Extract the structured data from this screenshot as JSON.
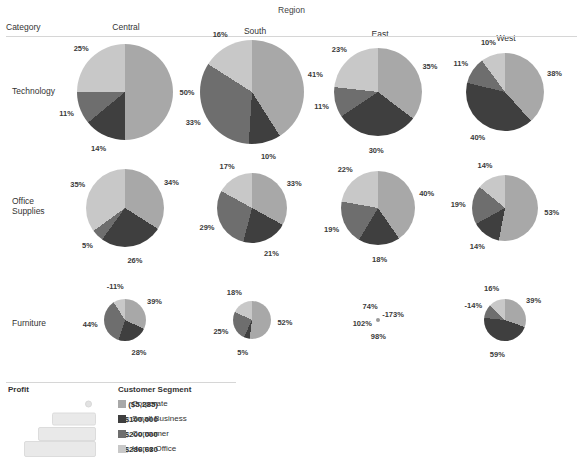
{
  "header": {
    "region_title": "Region",
    "category_header": "Category",
    "columns": [
      "Central",
      "South",
      "East",
      "West"
    ]
  },
  "rows": [
    "Technology",
    "Office Supplies",
    "Furniture"
  ],
  "legend": {
    "profit_title": "Profit",
    "segment_title": "Customer Segment",
    "profit_scale": [
      {
        "label": "($5,285)"
      },
      {
        "label": "$100,000"
      },
      {
        "label": "$200,000"
      },
      {
        "label": "$286,630"
      }
    ],
    "segments": [
      {
        "name": "Corporate",
        "color": "#a8a8a8"
      },
      {
        "name": "Small Business",
        "color": "#3f3f3f"
      },
      {
        "name": "Consumer",
        "color": "#6e6e6e"
      },
      {
        "name": "Home Office",
        "color": "#c8c8c8"
      }
    ]
  },
  "chart_data": {
    "type": "pie",
    "title": "Region",
    "xlabel": "Region",
    "ylabel": "Category",
    "legend_position": "bottom-left",
    "grid": false,
    "segment_names": [
      "Corporate",
      "Small Business",
      "Consumer",
      "Home Office"
    ],
    "segment_colors": [
      "#a8a8a8",
      "#3f3f3f",
      "#6e6e6e",
      "#c8c8c8"
    ],
    "columns": [
      "Central",
      "South",
      "East",
      "West"
    ],
    "categories": [
      "Technology",
      "Office Supplies",
      "Furniture"
    ],
    "cells": [
      {
        "category": "Technology",
        "region": "Central",
        "size": 96,
        "labels": [
          "50%",
          "14%",
          "11%",
          "25%"
        ],
        "values": [
          50,
          14,
          11,
          25
        ]
      },
      {
        "category": "Technology",
        "region": "South",
        "size": 104,
        "labels": [
          "41%",
          "10%",
          "33%",
          "16%"
        ],
        "values": [
          41,
          10,
          33,
          16
        ]
      },
      {
        "category": "Technology",
        "region": "East",
        "size": 88,
        "labels": [
          "35%",
          "30%",
          "11%",
          "23%"
        ],
        "values": [
          35,
          30,
          11,
          23
        ]
      },
      {
        "category": "Technology",
        "region": "West",
        "size": 78,
        "labels": [
          "38%",
          "40%",
          "11%",
          "10%"
        ],
        "values": [
          38,
          40,
          11,
          10
        ]
      },
      {
        "category": "Office Supplies",
        "region": "Central",
        "size": 78,
        "labels": [
          "34%",
          "26%",
          "5%",
          "35%"
        ],
        "values": [
          34,
          26,
          5,
          35
        ]
      },
      {
        "category": "Office Supplies",
        "region": "South",
        "size": 70,
        "labels": [
          "33%",
          "21%",
          "29%",
          "17%"
        ],
        "values": [
          33,
          21,
          29,
          17
        ]
      },
      {
        "category": "Office Supplies",
        "region": "East",
        "size": 74,
        "labels": [
          "40%",
          "18%",
          "19%",
          "22%"
        ],
        "values": [
          40,
          18,
          19,
          22
        ]
      },
      {
        "category": "Office Supplies",
        "region": "West",
        "size": 66,
        "labels": [
          "53%",
          "14%",
          "19%",
          "14%"
        ],
        "values": [
          53,
          14,
          19,
          14
        ]
      },
      {
        "category": "Furniture",
        "region": "Central",
        "size": 42,
        "labels": [
          "39%",
          "28%",
          "44%",
          "-11%"
        ],
        "values": [
          39,
          28,
          44,
          -11
        ]
      },
      {
        "category": "Furniture",
        "region": "South",
        "size": 38,
        "labels": [
          "52%",
          "5%",
          "25%",
          "18%"
        ],
        "values": [
          52,
          5,
          25,
          18
        ]
      },
      {
        "category": "Furniture",
        "region": "East",
        "size": 4,
        "labels": [
          "-173%",
          "98%",
          "102%",
          "74%"
        ],
        "values": [
          -173,
          98,
          102,
          74
        ]
      },
      {
        "category": "Furniture",
        "region": "West",
        "size": 42,
        "labels": [
          "39%",
          "59%",
          "-14%",
          "16%"
        ],
        "values": [
          39,
          59,
          -14,
          16
        ]
      }
    ]
  }
}
